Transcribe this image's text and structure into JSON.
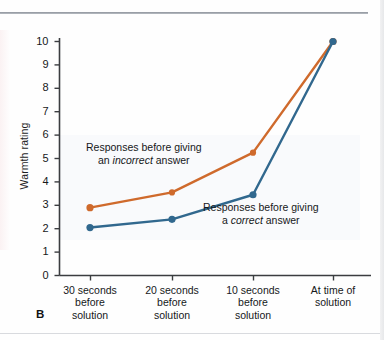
{
  "figure": {
    "panel_label": "B"
  },
  "chart_data": {
    "type": "line",
    "title": "",
    "xlabel": "",
    "ylabel": "Warmth rating",
    "categories": [
      "30 seconds\nbefore\nsolution",
      "20 seconds\nbefore\nsolution",
      "10 seconds\nbefore\nsolution",
      "At time of\nsolution"
    ],
    "category_lines": [
      [
        "30 seconds",
        "before",
        "solution"
      ],
      [
        "20 seconds",
        "before",
        "solution"
      ],
      [
        "10 seconds",
        "before",
        "solution"
      ],
      [
        "At time of",
        "solution"
      ]
    ],
    "ylim": [
      0,
      10
    ],
    "ytick_labels": [
      "0",
      "1",
      "2",
      "3",
      "4",
      "5",
      "6",
      "7",
      "8",
      "9",
      "10"
    ],
    "ytick_values": [
      0,
      1,
      2,
      3,
      4,
      5,
      6,
      7,
      8,
      9,
      10
    ],
    "grid": false,
    "legend_position": "inline-annotations",
    "series": [
      {
        "name": "Responses before giving an incorrect answer",
        "color": "#cf6a2c",
        "values": [
          2.9,
          3.55,
          5.25,
          10.0
        ]
      },
      {
        "name": "Responses before giving a correct answer",
        "color": "#31688e",
        "values": [
          2.05,
          2.4,
          3.45,
          10.0
        ]
      }
    ],
    "annotations": [
      {
        "id": "incorrect",
        "line1_pre": "Responses before giving",
        "line2_pre": "an ",
        "line2_em": "incorrect",
        "line2_post": " answer"
      },
      {
        "id": "correct",
        "line1_pre": "Responses before giving",
        "line2_pre": "a ",
        "line2_em": "correct",
        "line2_post": " answer"
      }
    ]
  }
}
